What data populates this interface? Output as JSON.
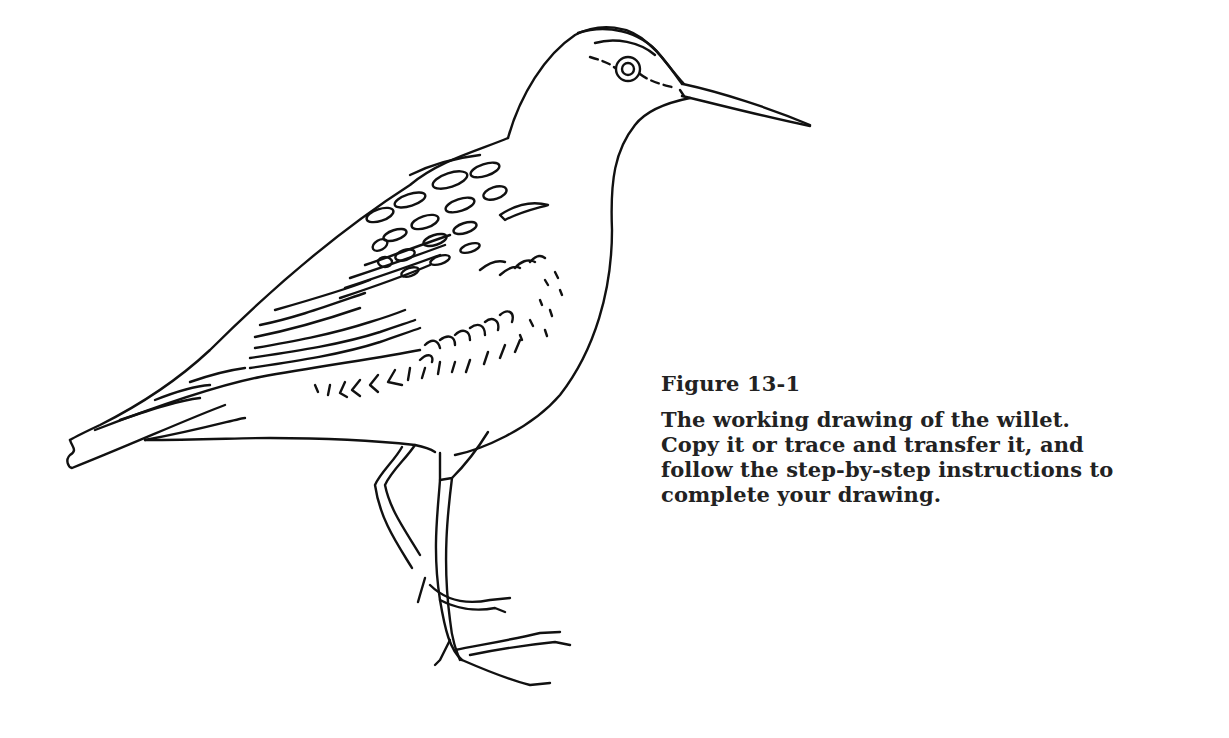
{
  "figure": {
    "subject": "willet",
    "illustration_icon": "willet-line-drawing",
    "stroke_color": "#111111",
    "background_color": "#ffffff"
  },
  "caption": {
    "label": "Figure 13-1",
    "lines": [
      "The working drawing of the willet.",
      "Copy it or trace and transfer it, and",
      "follow the step-by-step instructions to",
      "complete your drawing."
    ]
  }
}
